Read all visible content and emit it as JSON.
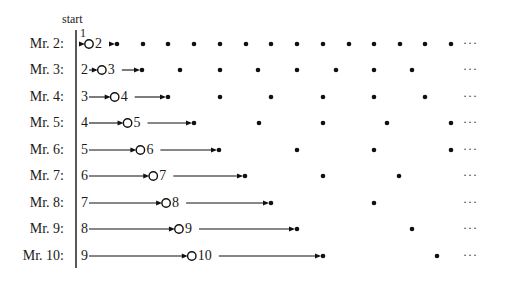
{
  "diagram": {
    "start_label": "start",
    "start_number": "1",
    "ellipsis": "···",
    "unit_px": 25.7,
    "origin_x": 89,
    "colors": {
      "ink": "#111111",
      "background": "#ffffff"
    },
    "rows": [
      {
        "label": "Mr. 2:",
        "y": 44,
        "prev": "",
        "cur": "2",
        "circle_pos": 0,
        "step": 1,
        "arrow_in": false
      },
      {
        "label": "Mr. 3:",
        "y": 70,
        "prev": "2",
        "cur": "3",
        "circle_pos": 0.5,
        "step": 1.5,
        "arrow_in": true
      },
      {
        "label": "Mr. 4:",
        "y": 97,
        "prev": "3",
        "cur": "4",
        "circle_pos": 1,
        "step": 2,
        "arrow_in": true
      },
      {
        "label": "Mr. 5:",
        "y": 123,
        "prev": "4",
        "cur": "5",
        "circle_pos": 1.5,
        "step": 2.5,
        "arrow_in": true
      },
      {
        "label": "Mr. 6:",
        "y": 150,
        "prev": "5",
        "cur": "6",
        "circle_pos": 2,
        "step": 3,
        "arrow_in": true
      },
      {
        "label": "Mr. 7:",
        "y": 176,
        "prev": "6",
        "cur": "7",
        "circle_pos": 2.5,
        "step": 3.5,
        "arrow_in": true
      },
      {
        "label": "Mr. 8:",
        "y": 203,
        "prev": "7",
        "cur": "8",
        "circle_pos": 3,
        "step": 4,
        "arrow_in": true
      },
      {
        "label": "Mr. 9:",
        "y": 229,
        "prev": "8",
        "cur": "9",
        "circle_pos": 3.5,
        "step": 4.5,
        "arrow_in": true
      },
      {
        "label": "Mr. 10:",
        "y": 256,
        "prev": "9",
        "cur": "10",
        "circle_pos": 4,
        "step": 5,
        "arrow_in": true
      }
    ],
    "dots_x": [
      [
        117,
        143,
        168,
        194,
        220,
        246,
        271,
        297,
        323,
        349,
        374,
        400,
        425,
        451
      ],
      [
        142,
        180,
        220,
        258,
        297,
        336,
        374,
        412
      ],
      [
        168,
        220,
        271,
        323,
        374,
        425
      ],
      [
        194,
        259,
        323,
        387,
        451
      ],
      [
        219,
        297,
        374,
        451
      ],
      [
        245,
        323,
        399
      ],
      [
        271,
        374
      ],
      [
        297,
        412
      ],
      [
        323,
        437
      ]
    ]
  }
}
